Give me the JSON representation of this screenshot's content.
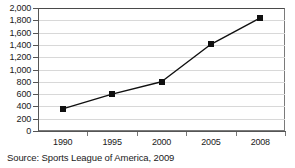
{
  "chart_data": {
    "type": "line",
    "title": "",
    "xlabel": "",
    "ylabel": "",
    "categories": [
      "1990",
      "1995",
      "2000",
      "2005",
      "2008"
    ],
    "values": [
      360,
      600,
      800,
      1410,
      1840
    ],
    "series": [
      {
        "name": "Value",
        "values": [
          360,
          600,
          800,
          1410,
          1840
        ]
      }
    ],
    "ylim": [
      0,
      2000
    ],
    "y_ticks": [
      "0",
      "200",
      "400",
      "600",
      "800",
      "1,000",
      "1,200",
      "1,400",
      "1,600",
      "1,800",
      "2,000"
    ],
    "y_tick_values": [
      0,
      200,
      400,
      600,
      800,
      1000,
      1200,
      1400,
      1600,
      1800,
      2000
    ],
    "grid": true,
    "legend": false,
    "legend_position": "none",
    "marker": "square",
    "line_color": "#101010",
    "marker_color": "#101010",
    "grid_color": "#d8d8d8",
    "axis_color": "#555555",
    "background_color": "#ffffff"
  },
  "caption": {
    "source_text": "Source: Sports League of America, 2009"
  }
}
